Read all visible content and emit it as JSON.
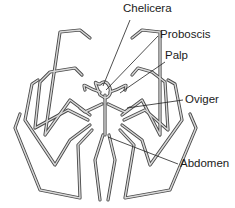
{
  "diagram": {
    "labels": [
      {
        "id": "chelicera",
        "text": "Chelicera",
        "x": 123,
        "y": 8
      },
      {
        "id": "proboscis",
        "text": "Proboscis",
        "x": 160,
        "y": 29
      },
      {
        "id": "palp",
        "text": "Palp",
        "x": 165,
        "y": 50
      },
      {
        "id": "oviger",
        "text": "Oviger",
        "x": 185,
        "y": 94
      },
      {
        "id": "abdomen",
        "text": "Abdomen",
        "x": 180,
        "y": 158
      }
    ],
    "colors": {
      "line": "#4a4a4a",
      "fill": "#d9d9d9",
      "text": "#1a1a1a",
      "background": "#ffffff"
    }
  }
}
